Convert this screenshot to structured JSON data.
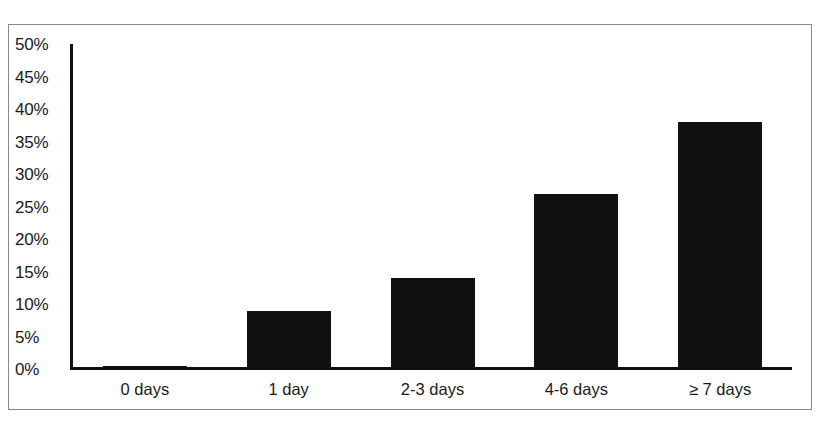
{
  "chart_data": {
    "type": "bar",
    "title": "",
    "subtitle": "",
    "xlabel": "",
    "ylabel": "",
    "categories": [
      "0 days",
      "1 day",
      "2-3 days",
      "4-6 days",
      "≥ 7 days"
    ],
    "values": [
      0.4,
      9,
      14,
      27,
      38
    ],
    "value_labels": [
      "0.4%",
      "9%",
      "14%",
      "27%",
      "38%"
    ],
    "ylim": [
      0,
      50
    ],
    "ytick_values": [
      50,
      45,
      40,
      35,
      30,
      25,
      20,
      15,
      10,
      5,
      0
    ],
    "ytick_labels": [
      "50%",
      "45%",
      "40%",
      "35%",
      "30%",
      "25%",
      "20%",
      "15%",
      "10%",
      "5%",
      "0%"
    ],
    "grid": false,
    "legend": null,
    "legend_position": "none",
    "series": [
      {
        "name": "Percent of respondents",
        "values": [
          0.4,
          9,
          14,
          27,
          38
        ],
        "color": "#111111"
      }
    ],
    "annotations": []
  },
  "figure": {
    "border_color": "#8a8a8a",
    "background": "#ffffff",
    "axis_color": "#111111",
    "bar_color": "#111111",
    "text_color": "#1a1a1a"
  }
}
